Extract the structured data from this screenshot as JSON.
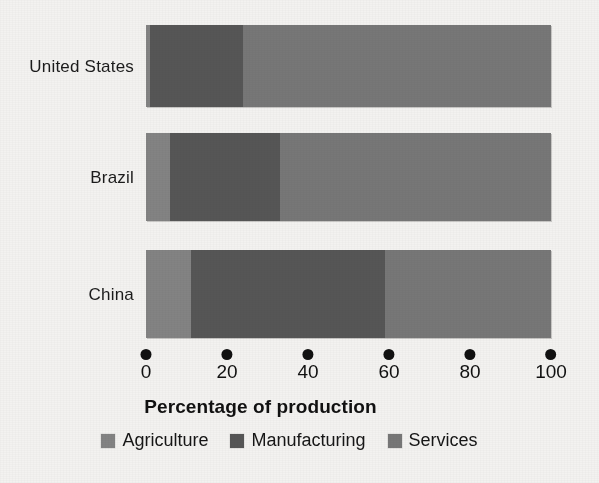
{
  "chart_data": {
    "type": "bar",
    "orientation": "horizontal",
    "stacked": true,
    "title": "",
    "xlabel": "Percentage of production",
    "ylabel": "",
    "categories": [
      "United States",
      "Brazil",
      "China"
    ],
    "series": [
      {
        "name": "Agriculture",
        "color": "#838383",
        "values": [
          1,
          6,
          11
        ]
      },
      {
        "name": "Manufacturing",
        "color": "#565656",
        "values": [
          23,
          27,
          48
        ]
      },
      {
        "name": "Services",
        "color": "#777777",
        "values": [
          76,
          67,
          41
        ]
      }
    ],
    "xlim": [
      0,
      100
    ],
    "xticks": [
      0,
      20,
      40,
      60,
      80,
      100
    ],
    "xtick_labels": [
      "0",
      "20",
      "40",
      "60",
      "80",
      "100"
    ],
    "grid": false,
    "legend_position": "bottom",
    "background_color": "#f3f2f0",
    "tick_marker": "filled-circle"
  },
  "axis": {
    "title": "Percentage of production",
    "ticks": [
      {
        "label": "0",
        "value": 0
      },
      {
        "label": "20",
        "value": 20
      },
      {
        "label": "40",
        "value": 40
      },
      {
        "label": "60",
        "value": 60
      },
      {
        "label": "80",
        "value": 80
      },
      {
        "label": "100",
        "value": 100
      }
    ]
  },
  "categories": [
    {
      "label": "United States"
    },
    {
      "label": "Brazil"
    },
    {
      "label": "China"
    }
  ],
  "legend": {
    "items": [
      {
        "label": "Agriculture",
        "color": "#838383"
      },
      {
        "label": "Manufacturing",
        "color": "#565656"
      },
      {
        "label": "Services",
        "color": "#777777"
      }
    ]
  }
}
